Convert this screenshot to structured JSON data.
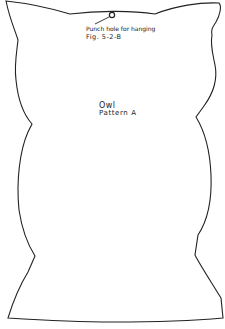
{
  "pattern": {
    "hole_note": "Punch hole for hanging",
    "figure_ref": "Fig. 5-2-B",
    "title": "Owl",
    "subtitle": "Pattern A"
  },
  "colors": {
    "line": "#222222",
    "background": "#ffffff"
  }
}
